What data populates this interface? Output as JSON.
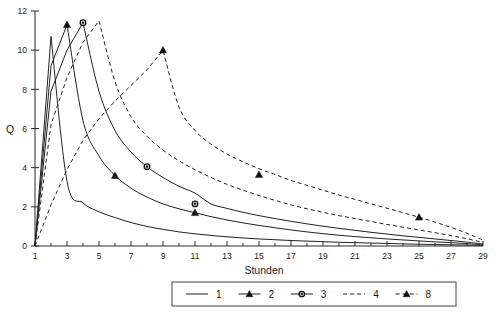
{
  "chart_data": {
    "type": "line",
    "title": "",
    "xlabel": "Stunden",
    "ylabel": "Q",
    "xlim": [
      1,
      29
    ],
    "ylim": [
      0,
      12
    ],
    "xticks": [
      1,
      3,
      5,
      7,
      9,
      11,
      13,
      15,
      17,
      19,
      21,
      23,
      25,
      27,
      29
    ],
    "xtick_labels": [
      "1",
      "3",
      "5",
      "7",
      "9",
      "11",
      "13",
      "15",
      "17",
      "19",
      "21",
      "23",
      "25",
      "27",
      "29"
    ],
    "yticks": [
      0,
      2,
      4,
      6,
      8,
      10,
      12
    ],
    "ytick_labels": [
      "0",
      "2",
      "4",
      "6",
      "8",
      "10",
      "12"
    ],
    "grid": false,
    "legend_position": "bottom",
    "x": [
      1,
      2,
      3,
      4,
      5,
      6,
      7,
      8,
      9,
      10,
      11,
      12,
      13,
      14,
      15,
      16,
      17,
      18,
      19,
      20,
      21,
      22,
      23,
      24,
      25,
      26,
      27,
      28,
      29
    ],
    "series": [
      {
        "name": "1",
        "label": "1",
        "style": "solid",
        "marker": "none",
        "values": [
          0,
          10.7,
          3.3,
          2.2,
          1.75,
          1.45,
          1.2,
          1.0,
          0.85,
          0.72,
          0.62,
          0.54,
          0.47,
          0.41,
          0.36,
          0.32,
          0.28,
          0.25,
          0.22,
          0.19,
          0.17,
          0.15,
          0.13,
          0.11,
          0.09,
          0.08,
          0.06,
          0.05,
          0.03
        ]
      },
      {
        "name": "2",
        "label": "2",
        "style": "solid",
        "marker": "triangle",
        "values": [
          0,
          9.2,
          11.3,
          6.4,
          4.6,
          3.6,
          2.95,
          2.5,
          2.15,
          1.9,
          1.7,
          1.5,
          1.33,
          1.18,
          1.05,
          0.93,
          0.82,
          0.72,
          0.63,
          0.55,
          0.48,
          0.42,
          0.36,
          0.31,
          0.26,
          0.21,
          0.17,
          0.12,
          0.06
        ]
      },
      {
        "name": "3",
        "label": "3",
        "style": "solid",
        "marker": "circle",
        "values": [
          0,
          7.9,
          10.0,
          11.4,
          7.9,
          5.9,
          4.8,
          4.05,
          3.5,
          3.05,
          2.7,
          2.15,
          1.92,
          1.72,
          1.55,
          1.4,
          1.26,
          1.13,
          1.01,
          0.9,
          0.8,
          0.7,
          0.61,
          0.52,
          0.44,
          0.36,
          0.28,
          0.2,
          0.1
        ]
      },
      {
        "name": "4",
        "label": "4",
        "style": "dashed",
        "marker": "none",
        "values": [
          0,
          6.2,
          8.6,
          10.4,
          11.5,
          8.4,
          6.6,
          5.6,
          4.9,
          4.35,
          3.9,
          3.5,
          3.15,
          2.85,
          2.58,
          2.33,
          2.1,
          1.9,
          1.72,
          1.55,
          1.4,
          1.25,
          1.1,
          0.96,
          0.82,
          0.68,
          0.53,
          0.37,
          0.18
        ]
      },
      {
        "name": "8",
        "label": "8",
        "style": "dashed",
        "marker": "triangle",
        "values": [
          0,
          2.1,
          3.9,
          5.4,
          6.5,
          7.4,
          8.2,
          9.0,
          10.0,
          7.1,
          5.9,
          5.2,
          4.7,
          4.3,
          3.95,
          3.65,
          3.35,
          3.1,
          2.85,
          2.6,
          2.38,
          2.15,
          1.93,
          1.7,
          1.47,
          1.22,
          0.95,
          0.65,
          0.3
        ]
      }
    ],
    "marker_points": [
      {
        "series": "2",
        "x": 3,
        "y": 11.3
      },
      {
        "series": "2",
        "x": 6,
        "y": 3.6
      },
      {
        "series": "2",
        "x": 11,
        "y": 1.7
      },
      {
        "series": "3",
        "x": 4,
        "y": 11.4
      },
      {
        "series": "3",
        "x": 8,
        "y": 4.05
      },
      {
        "series": "3",
        "x": 11,
        "y": 2.15
      },
      {
        "series": "8",
        "x": 9,
        "y": 10.0
      },
      {
        "series": "8",
        "x": 15,
        "y": 3.65
      },
      {
        "series": "8",
        "x": 25,
        "y": 1.47
      }
    ]
  },
  "legend": {
    "entries": [
      {
        "label": "1",
        "style": "solid",
        "marker": "none"
      },
      {
        "label": "2",
        "style": "solid",
        "marker": "triangle"
      },
      {
        "label": "3",
        "style": "solid",
        "marker": "circle"
      },
      {
        "label": "4",
        "style": "dashed",
        "marker": "none"
      },
      {
        "label": "8",
        "style": "dashed",
        "marker": "triangle"
      }
    ]
  },
  "colors": {
    "line": "#222222",
    "axis": "#2b2b2b",
    "text": "#1a1a1a",
    "background": "#ffffff"
  }
}
